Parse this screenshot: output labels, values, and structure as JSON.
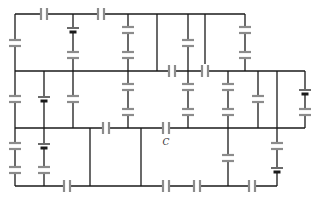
{
  "diagram": {
    "type": "circuit",
    "colors": {
      "wire": "#1a1a1a",
      "capacitor": "#8c8c8c",
      "battery": "#1a1a1a",
      "background": "#ffffff"
    },
    "labels": [
      {
        "text": "C",
        "x": 166,
        "y": 145
      }
    ],
    "wires": [
      [
        15,
        14,
        157,
        14
      ],
      [
        157,
        14,
        245,
        14
      ],
      [
        128,
        14,
        128,
        71
      ],
      [
        157,
        14,
        157,
        71
      ],
      [
        188,
        14,
        188,
        71
      ],
      [
        205,
        14,
        205,
        71
      ],
      [
        15,
        14,
        15,
        71
      ],
      [
        73,
        14,
        73,
        71
      ],
      [
        245,
        14,
        245,
        71
      ],
      [
        15,
        71,
        305,
        71
      ],
      [
        15,
        71,
        15,
        186
      ],
      [
        44,
        71,
        44,
        186
      ],
      [
        73,
        71,
        73,
        128
      ],
      [
        128,
        71,
        128,
        128
      ],
      [
        188,
        71,
        188,
        128
      ],
      [
        228,
        71,
        228,
        128
      ],
      [
        258,
        71,
        258,
        128
      ],
      [
        277,
        71,
        277,
        128
      ],
      [
        305,
        71,
        305,
        128
      ],
      [
        15,
        128,
        305,
        128
      ],
      [
        90,
        128,
        90,
        186
      ],
      [
        141,
        128,
        141,
        186
      ],
      [
        228,
        128,
        228,
        186
      ],
      [
        277,
        128,
        277,
        186
      ],
      [
        15,
        186,
        141,
        186
      ],
      [
        141,
        186,
        228,
        186
      ],
      [
        228,
        186,
        277,
        186
      ]
    ],
    "capacitors": [
      {
        "x": 44,
        "y": 14,
        "o": "v"
      },
      {
        "x": 101,
        "y": 14,
        "o": "v"
      },
      {
        "x": 15,
        "y": 43,
        "o": "h"
      },
      {
        "x": 73,
        "y": 55,
        "o": "h"
      },
      {
        "x": 128,
        "y": 30,
        "o": "h"
      },
      {
        "x": 128,
        "y": 55,
        "o": "h"
      },
      {
        "x": 188,
        "y": 43,
        "o": "h"
      },
      {
        "x": 245,
        "y": 30,
        "o": "h"
      },
      {
        "x": 245,
        "y": 55,
        "o": "h"
      },
      {
        "x": 172,
        "y": 71,
        "o": "v"
      },
      {
        "x": 205,
        "y": 71,
        "o": "v"
      },
      {
        "x": 15,
        "y": 99,
        "o": "h"
      },
      {
        "x": 73,
        "y": 99,
        "o": "h"
      },
      {
        "x": 128,
        "y": 87,
        "o": "h"
      },
      {
        "x": 128,
        "y": 112,
        "o": "h"
      },
      {
        "x": 188,
        "y": 87,
        "o": "h"
      },
      {
        "x": 188,
        "y": 112,
        "o": "h"
      },
      {
        "x": 228,
        "y": 87,
        "o": "h"
      },
      {
        "x": 228,
        "y": 112,
        "o": "h"
      },
      {
        "x": 258,
        "y": 99,
        "o": "h"
      },
      {
        "x": 305,
        "y": 112,
        "o": "h"
      },
      {
        "x": 106,
        "y": 128,
        "o": "v"
      },
      {
        "x": 166,
        "y": 128,
        "o": "v"
      },
      {
        "x": 15,
        "y": 146,
        "o": "h"
      },
      {
        "x": 15,
        "y": 170,
        "o": "h"
      },
      {
        "x": 44,
        "y": 170,
        "o": "h"
      },
      {
        "x": 228,
        "y": 158,
        "o": "h"
      },
      {
        "x": 277,
        "y": 146,
        "o": "h"
      },
      {
        "x": 67,
        "y": 186,
        "o": "v"
      },
      {
        "x": 166,
        "y": 186,
        "o": "v"
      },
      {
        "x": 197,
        "y": 186,
        "o": "v"
      },
      {
        "x": 252,
        "y": 186,
        "o": "v"
      }
    ],
    "batteries": [
      {
        "x": 73,
        "y": 30,
        "o": "h"
      },
      {
        "x": 44,
        "y": 99,
        "o": "h"
      },
      {
        "x": 44,
        "y": 146,
        "o": "h"
      },
      {
        "x": 305,
        "y": 92,
        "o": "h"
      },
      {
        "x": 277,
        "y": 170,
        "o": "h"
      }
    ]
  }
}
